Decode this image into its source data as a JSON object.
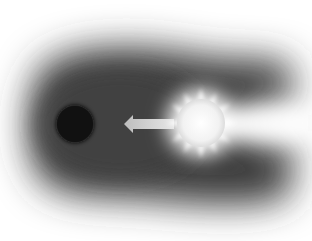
{
  "diagram": {
    "elements": [
      {
        "id": "dark-cloud",
        "type": "shadow-cloud",
        "color": "#3a3a3a"
      },
      {
        "id": "planet",
        "type": "dark-circle",
        "cx": 75,
        "cy": 124,
        "r": 19,
        "color": "#111111"
      },
      {
        "id": "arrow",
        "type": "arrow",
        "direction": "left",
        "from_x": 172,
        "to_x": 124,
        "y": 124,
        "color": "#c8c8c8"
      },
      {
        "id": "sun",
        "type": "star",
        "cx": 201,
        "cy": 123,
        "r": 24,
        "color": "#ffffff"
      }
    ],
    "colors": {
      "background": "#ffffff",
      "cloud": "#3a3a3a",
      "planet": "#111111",
      "sun": "#ffffff",
      "arrow": "#d0d0d0"
    }
  }
}
